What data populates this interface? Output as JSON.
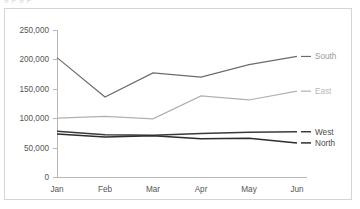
{
  "clipped_header": {
    "text": "g p g p"
  },
  "chart_data": {
    "type": "line",
    "title": "",
    "subtitle": "",
    "xlabel": "",
    "ylabel": "",
    "categories": [
      "Jan",
      "Feb",
      "Mar",
      "Apr",
      "May",
      "Jun"
    ],
    "ylim": [
      0,
      250000
    ],
    "ytick_values": [
      0,
      50000,
      100000,
      150000,
      200000,
      250000
    ],
    "ytick_labels": [
      "0",
      "50,000",
      "100,000",
      "150,000",
      "200,000",
      "250,000"
    ],
    "xtick_labels": [
      "Jan",
      "Feb",
      "Mar",
      "Apr",
      "May",
      "Jun"
    ],
    "grid": false,
    "legend_position": "right-inline-labels",
    "series": [
      {
        "name": "South",
        "label": "South",
        "color": "#6b6b6b",
        "label_color": "#9a9a9a",
        "width": 1.2,
        "values": [
          203000,
          136000,
          177000,
          170000,
          191000,
          205000
        ]
      },
      {
        "name": "East",
        "label": "East",
        "color": "#b0b0b0",
        "label_color": "#b8b8b8",
        "width": 1.2,
        "values": [
          100000,
          103000,
          99000,
          138000,
          131000,
          146000
        ]
      },
      {
        "name": "West",
        "label": "West",
        "color": "#3a3a3a",
        "label_color": "#4a4a4a",
        "width": 1.5,
        "values": [
          78000,
          72000,
          71000,
          74000,
          76000,
          77000
        ]
      },
      {
        "name": "North",
        "label": "North",
        "color": "#2e2e2e",
        "label_color": "#4a4a4a",
        "width": 1.5,
        "values": [
          73000,
          68000,
          70000,
          65000,
          66000,
          58000
        ]
      }
    ]
  },
  "colors": {
    "frame_border": "#d5d5d5",
    "axis": "#b9b9b9",
    "tick_text": "#555555",
    "background": "#ffffff"
  }
}
